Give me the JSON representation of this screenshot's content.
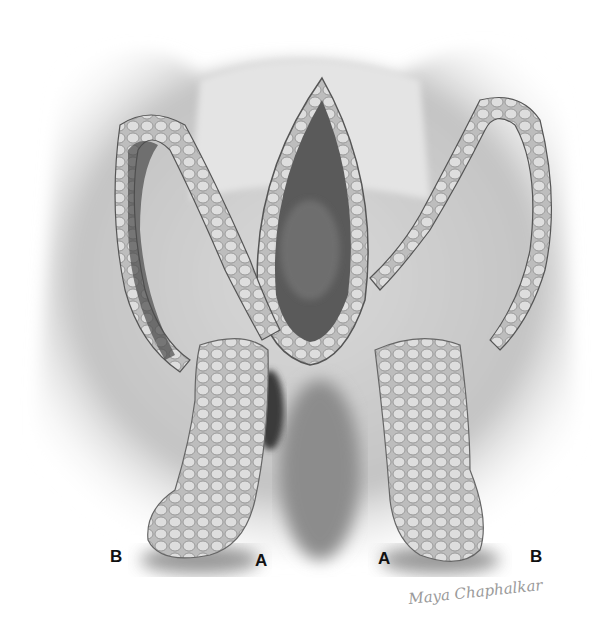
{
  "figure": {
    "labels": [
      {
        "id": "left-B",
        "text": "B",
        "x": 110,
        "y": 547
      },
      {
        "id": "left-A",
        "text": "A",
        "x": 255,
        "y": 551
      },
      {
        "id": "right-A",
        "text": "A",
        "x": 378,
        "y": 549
      },
      {
        "id": "right-B",
        "text": "B",
        "x": 530,
        "y": 547
      }
    ],
    "signature": "Maya Chaphalkar",
    "colors": {
      "background": "#ffffff",
      "skin_light": "#d8d8d8",
      "skin_mid": "#a9a9a9",
      "shadow": "#4a4a4a",
      "label": "#111111"
    }
  }
}
